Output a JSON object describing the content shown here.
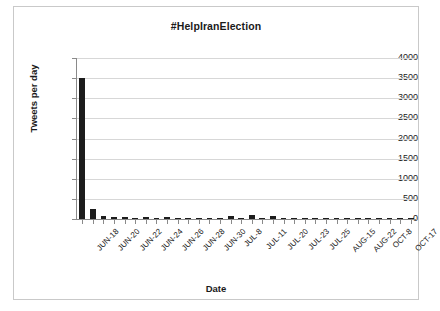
{
  "chart_data": {
    "type": "bar",
    "title": "#HelpIranElection",
    "xlabel": "Date",
    "ylabel": "Tweets per day",
    "ylim": [
      0,
      4000
    ],
    "ytick_step": 500,
    "yticks": [
      "0",
      "500",
      "1000",
      "1500",
      "2000",
      "2500",
      "3000",
      "3500",
      "4000"
    ],
    "grid": true,
    "legend": false,
    "tick_label_rotation": -45,
    "categories": [
      "JUN-18",
      "JUN-19",
      "JUN-20",
      "JUN-21",
      "JUN-22",
      "JUN-23",
      "JUN-24",
      "JUN-25",
      "JUN-26",
      "JUN-27",
      "JUN-28",
      "JUN-29",
      "JUN-30",
      "JUL-6",
      "JUL-8",
      "JUL-10",
      "JUL-11",
      "JUL-15",
      "JUL-20",
      "JUL-21",
      "JUL-23",
      "JUL-24",
      "JUL-25",
      "AUG-3",
      "AUG-15",
      "AUG-18",
      "AUG-22",
      "SEP-10",
      "OCT-8",
      "OCT-12",
      "OCT-17",
      "OCT-25"
    ],
    "displayed_tick_labels": [
      "JUN-18",
      "JUN-20",
      "JUN-22",
      "JUN-24",
      "JUN-26",
      "JUN-28",
      "JUN-30",
      "JUL-8",
      "JUL-11",
      "JUL-20",
      "JUL-23",
      "JUL-25",
      "AUG-15",
      "AUG-22",
      "OCT-8",
      "OCT-17"
    ],
    "values": [
      3500,
      255,
      70,
      40,
      55,
      30,
      45,
      25,
      40,
      20,
      30,
      15,
      25,
      10,
      70,
      15,
      90,
      20,
      65,
      10,
      15,
      8,
      12,
      6,
      10,
      5,
      8,
      4,
      6,
      3,
      5,
      3
    ],
    "bar_color": "#1c1c1c",
    "grid_color": "#d7d7d7",
    "axis_color": "#8a8a8a",
    "background_color": "#ffffff"
  }
}
